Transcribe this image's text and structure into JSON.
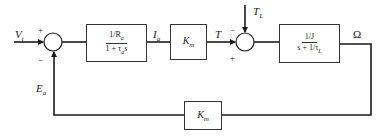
{
  "diagram": {
    "type": "feedback-control-block-diagram",
    "input_label": "V",
    "input_sub": "t",
    "sum1": {
      "plus_sign": "+",
      "minus_sign": "−"
    },
    "block_armature": {
      "numerator": "1/R",
      "numerator_sub": "a",
      "denominator": "1 + τ",
      "denominator_sub": "a",
      "denominator_tail": "s"
    },
    "current_label": "I",
    "current_sub": "a",
    "block_torque_gain": {
      "label": "K",
      "sub": "m"
    },
    "torque_label": "T",
    "load_torque_label": "T",
    "load_torque_sub": "L",
    "sum2": {
      "minus_sign": "−",
      "plus_sign": "+"
    },
    "block_mechanical": {
      "numerator": "1/J",
      "denominator": "s + 1/τ",
      "denominator_sub": "L"
    },
    "output_label": "Ω",
    "feedback_label": "E",
    "feedback_sub": "a",
    "block_feedback_gain": {
      "label": "K",
      "sub": "m"
    },
    "colors": {
      "line": "#1a1a1a",
      "box_border": "#333333",
      "background": "#ffffff"
    }
  }
}
